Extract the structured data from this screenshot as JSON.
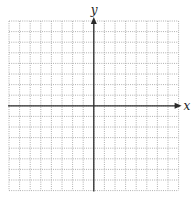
{
  "chart_data": {
    "type": "coordinate-grid",
    "title": "",
    "xlabel": "x",
    "ylabel": "y",
    "grid": true,
    "grid_style": "dotted",
    "cells_left_of_y_axis": 8,
    "cells_right_of_y_axis": 8,
    "cells_above_x_axis": 8,
    "cells_below_x_axis": 8,
    "xlim": [
      -8,
      8
    ],
    "ylim": [
      -8,
      8
    ],
    "tick_labels": [],
    "data_points": [],
    "positive_axis_arrows": true
  },
  "layout": {
    "grid_left": 9,
    "grid_top": 21,
    "cell_size": 10.6,
    "origin_x": 93.8,
    "origin_y": 105.8,
    "grid_color": "#9a9a9a",
    "axis_color": "#2a2a2a"
  },
  "labels": {
    "x_axis": "x",
    "y_axis": "y"
  }
}
